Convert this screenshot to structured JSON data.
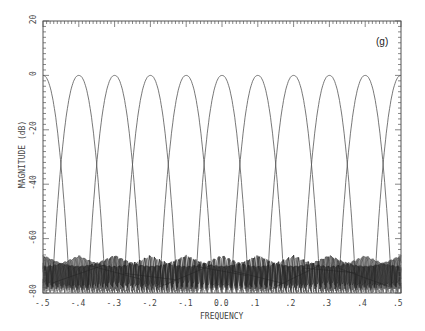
{
  "chart_data": {
    "type": "line",
    "title": "",
    "panel_label": "(g)",
    "xlabel": "FREQUENCY",
    "ylabel": "MAGNITUDE (dB)",
    "xlim": [
      -0.5,
      0.5
    ],
    "ylim": [
      -80,
      20
    ],
    "x_ticks": [
      "-.5",
      "-.4",
      "-.3",
      "-.2",
      "-.1",
      "0.0",
      ".1",
      ".2",
      ".3",
      ".4",
      ".5"
    ],
    "y_ticks": [
      "20",
      "0",
      "-20",
      "-40",
      "-60",
      "-80"
    ],
    "grid": false,
    "legend": null,
    "series_description": "Bank of 11 bandpass filter magnitude responses, main lobes peaking at 0 dB, centered at frequencies spaced 0.1 apart; sidelobes around -65 to -80 dB",
    "series": [
      {
        "name": "filter -0.5",
        "center": -0.5,
        "peak_db": 0
      },
      {
        "name": "filter -0.4",
        "center": -0.4,
        "peak_db": 0
      },
      {
        "name": "filter -0.3",
        "center": -0.3,
        "peak_db": 0
      },
      {
        "name": "filter -0.2",
        "center": -0.2,
        "peak_db": 0
      },
      {
        "name": "filter -0.1",
        "center": -0.1,
        "peak_db": 0
      },
      {
        "name": "filter 0.0",
        "center": 0.0,
        "peak_db": 0
      },
      {
        "name": "filter 0.1",
        "center": 0.1,
        "peak_db": 0
      },
      {
        "name": "filter 0.2",
        "center": 0.2,
        "peak_db": 0
      },
      {
        "name": "filter 0.3",
        "center": 0.3,
        "peak_db": 0
      },
      {
        "name": "filter 0.4",
        "center": 0.4,
        "peak_db": 0
      },
      {
        "name": "filter 0.5",
        "center": 0.5,
        "peak_db": 0
      }
    ],
    "main_lobe_halfwidth": 0.075,
    "sidelobe_level_db": -66
  }
}
